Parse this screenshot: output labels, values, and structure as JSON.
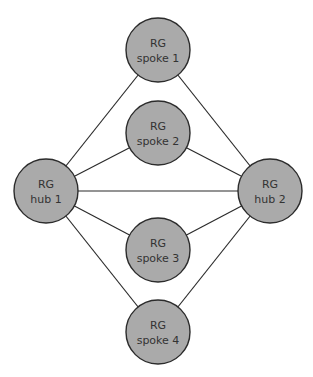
{
  "diagram": {
    "type": "network-topology",
    "node_fill": "#aaaaaa",
    "stroke_color": "#2b2b2b",
    "nodes": [
      {
        "id": "spoke1",
        "line1": "RG",
        "line2": "spoke 1",
        "cx": 158,
        "cy": 50
      },
      {
        "id": "spoke2",
        "line1": "RG",
        "line2": "spoke 2",
        "cx": 158,
        "cy": 133
      },
      {
        "id": "hub1",
        "line1": "RG",
        "line2": "hub 1",
        "cx": 46,
        "cy": 191
      },
      {
        "id": "hub2",
        "line1": "RG",
        "line2": "hub 2",
        "cx": 270,
        "cy": 191
      },
      {
        "id": "spoke3",
        "line1": "RG",
        "line2": "spoke 3",
        "cx": 158,
        "cy": 250
      },
      {
        "id": "spoke4",
        "line1": "RG",
        "line2": "spoke 4",
        "cx": 158,
        "cy": 332
      }
    ],
    "edges": [
      [
        "hub1",
        "spoke1"
      ],
      [
        "hub1",
        "spoke2"
      ],
      [
        "hub1",
        "hub2"
      ],
      [
        "hub1",
        "spoke3"
      ],
      [
        "hub1",
        "spoke4"
      ],
      [
        "hub2",
        "spoke1"
      ],
      [
        "hub2",
        "spoke2"
      ],
      [
        "hub2",
        "spoke3"
      ],
      [
        "hub2",
        "spoke4"
      ]
    ]
  }
}
